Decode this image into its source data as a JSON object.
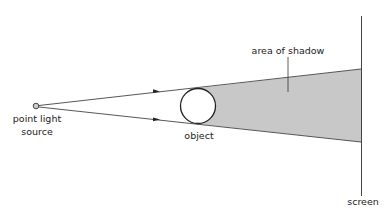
{
  "diagram": {
    "labels": {
      "source_line1": "point light",
      "source_line2": "source",
      "object": "object",
      "shadow": "area of shadow",
      "screen": "screen"
    },
    "colors": {
      "line": "#444444",
      "shadow_fill": "#c8c8c8",
      "source_fill": "#cccccc",
      "text": "#222222"
    },
    "elements": {
      "source": {
        "cx": 36,
        "cy": 106,
        "r": 3
      },
      "object": {
        "cx": 198,
        "cy": 106,
        "r": 18
      },
      "screen": {
        "x": 361,
        "y1": 16,
        "y2": 197
      },
      "upper_ray": {
        "x1": 39,
        "y1": 106,
        "x2": 361,
        "y2": 69
      },
      "lower_ray": {
        "x1": 39,
        "y1": 107,
        "x2": 361,
        "y2": 142
      },
      "shadow_polygon": "203,88 361,69 361,142 203,124"
    }
  }
}
